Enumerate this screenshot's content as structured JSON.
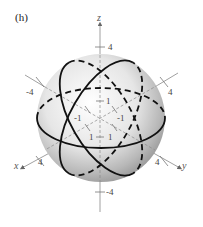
{
  "figure": {
    "panel_label": "(h)",
    "colors": {
      "sphere_highlight": "#ffffff",
      "sphere_shade": "#9a9a9a",
      "circle_stroke": "#111111",
      "axis_stroke": "#888888"
    },
    "axes": {
      "x": {
        "label": "x",
        "ticks": [
          "4",
          "-4"
        ]
      },
      "y": {
        "label": "y",
        "ticks": [
          "4",
          "-4"
        ]
      },
      "z": {
        "label": "z",
        "ticks": [
          "4",
          "-4"
        ]
      }
    },
    "inner_ticks": [
      "1",
      "-1",
      "-1",
      "1",
      "1",
      "1"
    ],
    "sphere_radius_label": "4"
  }
}
